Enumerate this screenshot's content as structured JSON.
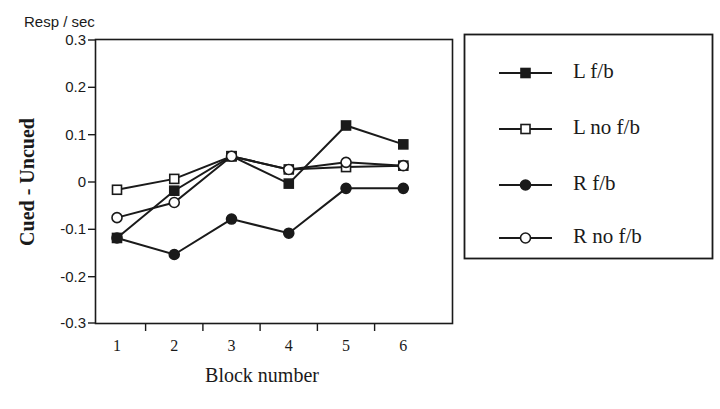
{
  "chart_data": {
    "type": "line",
    "title": "",
    "unit_annotation": "Resp / sec",
    "xlabel": "Block number",
    "ylabel": "Cued - Uncued",
    "categories": [
      "1",
      "2",
      "3",
      "4",
      "5",
      "6"
    ],
    "x": [
      1,
      2,
      3,
      4,
      5,
      6
    ],
    "ylim": [
      -0.3,
      0.3
    ],
    "xlim": [
      0.5,
      6.5
    ],
    "ytick_labels": [
      "0.3",
      "0.2",
      "0.1",
      "0",
      "-0.1",
      "-0.2",
      "-0.3"
    ],
    "yticks": [
      0.3,
      0.2,
      0.1,
      0,
      -0.1,
      -0.2,
      -0.3
    ],
    "grid": false,
    "legend_position": "right-outside",
    "series": [
      {
        "name": "L f/b",
        "marker": "filled-square",
        "values": [
          -0.12,
          -0.02,
          0.053,
          -0.005,
          0.118,
          0.078
        ]
      },
      {
        "name": "L no f/b",
        "marker": "open-square",
        "values": [
          -0.018,
          0.005,
          0.053,
          0.025,
          0.03,
          0.033
        ]
      },
      {
        "name": "R f/b",
        "marker": "filled-circle",
        "values": [
          -0.12,
          -0.155,
          -0.08,
          -0.11,
          -0.015,
          -0.015
        ]
      },
      {
        "name": "R no f/b",
        "marker": "open-circle",
        "values": [
          -0.077,
          -0.045,
          0.053,
          0.025,
          0.04,
          0.033
        ]
      }
    ],
    "colors": {
      "axis": "#1a1a1a",
      "series": "#1a1a1a",
      "background": "#ffffff"
    }
  }
}
